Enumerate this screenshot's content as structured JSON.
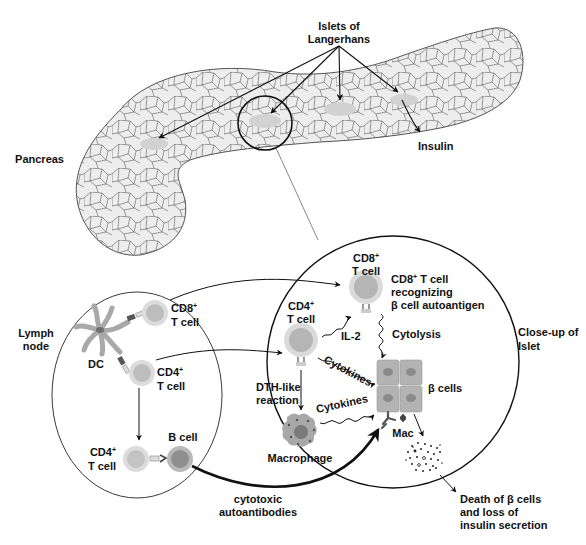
{
  "diagram": {
    "type": "immunology-flow",
    "colors": {
      "tissue_fill": "#ededed",
      "tissue_stroke": "#555555",
      "islet_fill": "#d6d6d6",
      "cell_outer": "#d9d9d9",
      "cell_inner": "#b5b5b5",
      "b_cell_inner": "#8f8f8f",
      "beta_cell": "#b3b3b3",
      "beta_nucleus": "#8a8a8a",
      "macrophage": "#9a9a9a",
      "line": "#111111"
    },
    "pancreas": {
      "label": "Pancreas",
      "islets_label_line1": "Islets of",
      "islets_label_line2": "Langerhans",
      "insulin_label": "Insulin"
    },
    "lymph_node": {
      "label_line1": "Lymph",
      "label_line2": "node",
      "dc_label": "DC",
      "cd8_label_line1": "CD8",
      "cd8_sup": "+",
      "cd8_label_line2": "T cell",
      "cd4_label_line1": "CD4",
      "cd4_sup": "+",
      "cd4_label_line2": "T cell",
      "cd4b_label_line1": "CD4",
      "cd4b_sup": "+",
      "cd4b_label_line2": "T cell",
      "b_cell_label": "B cell"
    },
    "islet_closeup": {
      "label_line1": "Close-up of",
      "label_line2": "Islet",
      "cd8_label_line1": "CD8",
      "cd8_sup": "+",
      "cd8_label_line2": "T cell",
      "cd8_desc_line1": "CD8",
      "cd8_desc_sup": "+",
      "cd8_desc_line1_rest": " T cell",
      "cd8_desc_line2": "recognizing",
      "cd8_desc_line3": "β cell autoantigen",
      "cd4_label_line1": "CD4",
      "cd4_sup": "+",
      "cd4_label_line2": "T cell",
      "il2_label": "IL-2",
      "cytolysis_label": "Cytolysis",
      "cytokines_label_1": "Cytokines",
      "cytokines_label_2": "Cytokines",
      "dth_label_line1": "DTH-like",
      "dth_label_line2": "reaction",
      "macrophage_label": "Macrophage",
      "beta_cells_label": "β cells",
      "mac_label": "Mac"
    },
    "outcome": {
      "autoantibodies_line1": "cytotoxic",
      "autoantibodies_line2": "autoantibodies",
      "death_line1": "Death of β cells",
      "death_line2": "and loss of",
      "death_line3": "insulin secretion"
    }
  }
}
